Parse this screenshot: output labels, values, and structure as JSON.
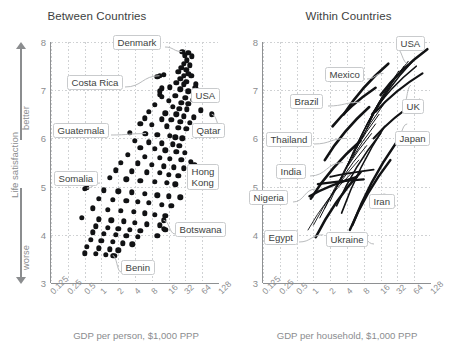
{
  "figure": {
    "ylabel": "Life satisfaction",
    "arrow_up": "better",
    "arrow_down": "worse",
    "yticks": [
      "8",
      "7",
      "6",
      "5",
      "4",
      "3"
    ],
    "xticks": [
      "0.125",
      "0.25",
      "0.5",
      "1",
      "2",
      "4",
      "8",
      "16",
      "32",
      "64",
      "128"
    ],
    "ylim": [
      3,
      8
    ],
    "xlim_log2": [
      -3,
      7
    ],
    "colors": {
      "dot": "#111214",
      "axis": "#8e9092",
      "grid": "#cfd1d3",
      "text": "#57585a",
      "tick_text": "#8b8d8f",
      "title": "#3d3f41"
    }
  },
  "panels": [
    {
      "title": "Between Countries",
      "xlabel": "GDP per person, $1,000 PPP"
    },
    {
      "title": "Within Countries",
      "xlabel": "GDP per household, $1,000 PPP"
    }
  ],
  "chart_data": [
    {
      "type": "scatter",
      "title": "Between Countries",
      "xlabel": "GDP per person, $1,000 PPP",
      "ylabel": "Life satisfaction",
      "xscale": "log2",
      "xlim": [
        0.125,
        128
      ],
      "ylim": [
        3,
        8
      ],
      "grid": true,
      "xticks": [
        0.125,
        0.25,
        0.5,
        1,
        2,
        4,
        8,
        16,
        32,
        64,
        128
      ],
      "yticks": [
        3,
        4,
        5,
        6,
        7,
        8
      ],
      "annotations": [
        "Denmark",
        "Costa Rica",
        "USA",
        "Guatemala",
        "Qatar",
        "Somalia",
        "Hong Kong",
        "Botswana",
        "Benin"
      ],
      "points": [
        [
          36,
          7.78
        ],
        [
          31,
          7.72
        ],
        [
          42,
          7.7
        ],
        [
          34,
          7.62
        ],
        [
          30,
          7.55
        ],
        [
          38,
          7.52
        ],
        [
          27,
          7.46
        ],
        [
          33,
          7.42
        ],
        [
          24,
          7.38
        ],
        [
          36,
          7.34
        ],
        [
          30,
          7.3
        ],
        [
          41,
          7.3
        ],
        [
          26,
          7.24
        ],
        [
          13,
          7.32
        ],
        [
          10,
          7.28
        ],
        [
          33,
          7.18
        ],
        [
          22,
          7.15
        ],
        [
          30,
          7.12
        ],
        [
          49,
          7.12
        ],
        [
          17,
          7.06
        ],
        [
          12,
          7.04
        ],
        [
          11,
          6.98
        ],
        [
          26,
          7.02
        ],
        [
          36,
          6.98
        ],
        [
          11,
          6.9
        ],
        [
          12,
          6.86
        ],
        [
          21,
          6.88
        ],
        [
          32,
          6.84
        ],
        [
          44,
          6.8
        ],
        [
          16,
          6.78
        ],
        [
          27,
          6.74
        ],
        [
          36,
          6.72
        ],
        [
          9,
          6.7
        ],
        [
          19,
          6.66
        ],
        [
          25,
          6.62
        ],
        [
          34,
          6.6
        ],
        [
          60,
          6.58
        ],
        [
          7,
          6.55
        ],
        [
          14,
          6.52
        ],
        [
          22,
          6.5
        ],
        [
          30,
          6.46
        ],
        [
          45,
          6.44
        ],
        [
          6,
          6.42
        ],
        [
          12,
          6.4
        ],
        [
          18,
          6.38
        ],
        [
          26,
          6.35
        ],
        [
          38,
          6.32
        ],
        [
          5,
          6.3
        ],
        [
          8,
          6.28
        ],
        [
          15,
          6.25
        ],
        [
          24,
          6.22
        ],
        [
          33,
          6.2
        ],
        [
          3.2,
          6.12
        ],
        [
          6,
          6.1
        ],
        [
          10,
          6.08
        ],
        [
          17,
          6.05
        ],
        [
          21,
          6.02
        ],
        [
          28,
          6.0
        ],
        [
          4,
          5.95
        ],
        [
          7,
          5.92
        ],
        [
          12,
          5.9
        ],
        [
          19,
          5.88
        ],
        [
          25,
          5.85
        ],
        [
          5,
          5.8
        ],
        [
          9,
          5.78
        ],
        [
          14,
          5.75
        ],
        [
          22,
          5.72
        ],
        [
          31,
          5.7
        ],
        [
          3,
          5.66
        ],
        [
          6,
          5.62
        ],
        [
          11,
          5.6
        ],
        [
          17,
          5.58
        ],
        [
          27,
          5.56
        ],
        [
          40,
          5.52
        ],
        [
          2.2,
          5.5
        ],
        [
          4.5,
          5.48
        ],
        [
          8,
          5.45
        ],
        [
          13,
          5.42
        ],
        [
          20,
          5.4
        ],
        [
          30,
          5.38
        ],
        [
          1.8,
          5.34
        ],
        [
          3.5,
          5.32
        ],
        [
          6.5,
          5.3
        ],
        [
          11,
          5.28
        ],
        [
          16,
          5.25
        ],
        [
          24,
          5.22
        ],
        [
          55,
          5.3
        ],
        [
          1.4,
          5.18
        ],
        [
          2.8,
          5.15
        ],
        [
          5,
          5.12
        ],
        [
          9,
          5.1
        ],
        [
          15,
          5.08
        ],
        [
          21,
          5.05
        ],
        [
          0.5,
          4.95
        ],
        [
          1.1,
          4.92
        ],
        [
          2,
          4.9
        ],
        [
          3.5,
          4.88
        ],
        [
          6,
          4.85
        ],
        [
          10,
          4.82
        ],
        [
          16,
          4.8
        ],
        [
          26,
          4.78
        ],
        [
          0.9,
          4.75
        ],
        [
          1.6,
          4.72
        ],
        [
          2.8,
          4.7
        ],
        [
          4.5,
          4.68
        ],
        [
          7,
          4.66
        ],
        [
          12,
          4.62
        ],
        [
          18,
          4.6
        ],
        [
          0.7,
          4.55
        ],
        [
          1.3,
          4.52
        ],
        [
          2.2,
          4.5
        ],
        [
          3.8,
          4.48
        ],
        [
          6,
          4.45
        ],
        [
          9,
          4.42
        ],
        [
          14,
          4.4
        ],
        [
          0.45,
          4.35
        ],
        [
          0.9,
          4.32
        ],
        [
          1.5,
          4.3
        ],
        [
          2.5,
          4.28
        ],
        [
          4,
          4.25
        ],
        [
          6.5,
          4.22
        ],
        [
          11,
          4.2
        ],
        [
          0.8,
          4.18
        ],
        [
          1.3,
          4.15
        ],
        [
          2,
          4.12
        ],
        [
          3.2,
          4.1
        ],
        [
          5,
          4.08
        ],
        [
          13,
          4.12
        ],
        [
          14,
          4.1
        ],
        [
          0.7,
          4.05
        ],
        [
          1.1,
          4.02
        ],
        [
          1.8,
          4.0
        ],
        [
          2.8,
          3.98
        ],
        [
          4.5,
          3.96
        ],
        [
          10,
          3.98
        ],
        [
          0.65,
          3.9
        ],
        [
          1,
          3.88
        ],
        [
          1.6,
          3.85
        ],
        [
          2.4,
          3.82
        ],
        [
          3.6,
          3.8
        ],
        [
          0.55,
          3.75
        ],
        [
          0.9,
          3.72
        ],
        [
          1.4,
          3.7
        ],
        [
          2,
          3.68
        ],
        [
          0.5,
          3.62
        ],
        [
          0.8,
          3.6
        ],
        [
          1.2,
          3.58
        ],
        [
          1.7,
          3.56
        ]
      ],
      "labeled_points": [
        {
          "name": "Denmark",
          "x": 28,
          "y": 7.8
        },
        {
          "name": "Costa Rica",
          "x": 11,
          "y": 7.3
        },
        {
          "name": "USA",
          "x": 48,
          "y": 7.05
        },
        {
          "name": "Guatemala",
          "x": 6.3,
          "y": 6.1
        },
        {
          "name": "Qatar",
          "x": 95,
          "y": 6.5
        },
        {
          "name": "Somalia",
          "x": 0.55,
          "y": 4.97
        },
        {
          "name": "Hong Kong",
          "x": 46,
          "y": 5.45
        },
        {
          "name": "Botswana",
          "x": 13,
          "y": 4.3
        },
        {
          "name": "Benin",
          "x": 1.6,
          "y": 3.57
        }
      ]
    },
    {
      "type": "line",
      "title": "Within Countries",
      "xlabel": "GDP per household, $1,000 PPP",
      "ylabel": "Life satisfaction",
      "xscale": "log2",
      "xlim": [
        0.125,
        128
      ],
      "ylim": [
        3,
        8
      ],
      "grid": true,
      "xticks": [
        0.125,
        0.25,
        0.5,
        1,
        2,
        4,
        8,
        16,
        32,
        64,
        128
      ],
      "yticks": [
        3,
        4,
        5,
        6,
        7,
        8
      ],
      "annotations": [
        "USA",
        "Mexico",
        "UK",
        "Brazil",
        "Japan",
        "Thailand",
        "India",
        "Nigeria",
        "Iran",
        "Egypt",
        "Ukraine"
      ],
      "series": [
        {
          "name": "USA",
          "x": [
            16,
            110
          ],
          "y": [
            6.9,
            7.85
          ],
          "weight": 2.6
        },
        {
          "name": "UK",
          "x": [
            13,
            90
          ],
          "y": [
            6.55,
            7.35
          ],
          "weight": 2.2
        },
        {
          "name": "Japan",
          "x": [
            12,
            80
          ],
          "y": [
            6.0,
            6.8
          ],
          "weight": 2.2
        },
        {
          "name": "Mexico",
          "x": [
            3.5,
            22
          ],
          "y": [
            6.5,
            7.55
          ],
          "weight": 2.6
        },
        {
          "name": "Brazil",
          "x": [
            2.2,
            13
          ],
          "y": [
            6.25,
            7.05
          ],
          "weight": 2.6
        },
        {
          "name": "Thailand",
          "x": [
            1.6,
            10
          ],
          "y": [
            5.55,
            6.65
          ],
          "weight": 2.6
        },
        {
          "name": "India",
          "x": [
            0.9,
            7
          ],
          "y": [
            4.75,
            5.95
          ],
          "weight": 2.6
        },
        {
          "name": "Nigeria",
          "x": [
            0.85,
            6
          ],
          "y": [
            4.8,
            5.2
          ],
          "weight": 2.4
        },
        {
          "name": "Iran",
          "x": [
            5,
            30
          ],
          "y": [
            4.2,
            5.9
          ],
          "weight": 2.4
        },
        {
          "name": "Egypt",
          "x": [
            1.1,
            7
          ],
          "y": [
            3.95,
            5.3
          ],
          "weight": 2.6
        },
        {
          "name": "Ukraine",
          "x": [
            4.5,
            24
          ],
          "y": [
            4.1,
            5.55
          ],
          "weight": 2.4
        },
        {
          "name": "other-1",
          "x": [
            1.3,
            9
          ],
          "y": [
            4.35,
            5.85
          ],
          "weight": 1.0
        },
        {
          "name": "other-2",
          "x": [
            1.6,
            11
          ],
          "y": [
            4.55,
            6.1
          ],
          "weight": 1.0
        },
        {
          "name": "other-3",
          "x": [
            2.0,
            13
          ],
          "y": [
            4.7,
            6.3
          ],
          "weight": 1.0
        },
        {
          "name": "other-4",
          "x": [
            2.4,
            15
          ],
          "y": [
            4.9,
            6.5
          ],
          "weight": 1.0
        },
        {
          "name": "other-5",
          "x": [
            3.0,
            18
          ],
          "y": [
            5.1,
            6.7
          ],
          "weight": 1.0
        },
        {
          "name": "other-6",
          "x": [
            3.6,
            20
          ],
          "y": [
            5.3,
            6.9
          ],
          "weight": 1.0
        },
        {
          "name": "other-7",
          "x": [
            4.2,
            24
          ],
          "y": [
            5.45,
            7.1
          ],
          "weight": 1.0
        },
        {
          "name": "other-8",
          "x": [
            5.0,
            28
          ],
          "y": [
            5.6,
            7.25
          ],
          "weight": 1.0
        },
        {
          "name": "other-9",
          "x": [
            6.0,
            34
          ],
          "y": [
            5.8,
            7.4
          ],
          "weight": 1.0
        },
        {
          "name": "other-10",
          "x": [
            7.5,
            42
          ],
          "y": [
            6.0,
            7.5
          ],
          "weight": 1.0
        },
        {
          "name": "other-11",
          "x": [
            9,
            50
          ],
          "y": [
            6.2,
            7.6
          ],
          "weight": 1.0
        },
        {
          "name": "other-12",
          "x": [
            0.8,
            5
          ],
          "y": [
            4.1,
            5.3
          ],
          "weight": 0.9
        },
        {
          "name": "other-13",
          "x": [
            1.0,
            6.5
          ],
          "y": [
            4.2,
            5.55
          ],
          "weight": 0.9
        },
        {
          "name": "other-14",
          "x": [
            2.6,
            16
          ],
          "y": [
            4.6,
            6.1
          ],
          "weight": 1.6
        },
        {
          "name": "other-15",
          "x": [
            3.2,
            19
          ],
          "y": [
            4.45,
            6.25
          ],
          "weight": 1.6
        },
        {
          "name": "other-16",
          "x": [
            10,
            60
          ],
          "y": [
            6.35,
            7.6
          ],
          "weight": 1.6
        },
        {
          "name": "other-17",
          "x": [
            11,
            70
          ],
          "y": [
            6.5,
            7.5
          ],
          "weight": 1.4
        },
        {
          "name": "other-18",
          "x": [
            1.2,
            8
          ],
          "y": [
            5.05,
            5.15
          ],
          "weight": 2.2
        },
        {
          "name": "other-19",
          "x": [
            2.0,
            12
          ],
          "y": [
            5.2,
            5.35
          ],
          "weight": 1.8
        }
      ],
      "labeled_segments": [
        {
          "name": "USA",
          "anchor_x": 50,
          "anchor_y": 7.55
        },
        {
          "name": "Mexico",
          "anchor_x": 18,
          "anchor_y": 7.35
        },
        {
          "name": "UK",
          "anchor_x": 56,
          "anchor_y": 7.1
        },
        {
          "name": "Brazil",
          "anchor_x": 7,
          "anchor_y": 6.75
        },
        {
          "name": "Japan",
          "anchor_x": 48,
          "anchor_y": 6.3
        },
        {
          "name": "Thailand",
          "anchor_x": 4,
          "anchor_y": 6.0
        },
        {
          "name": "India",
          "anchor_x": 3.4,
          "anchor_y": 5.5
        },
        {
          "name": "Nigeria",
          "anchor_x": 1.1,
          "anchor_y": 4.95
        },
        {
          "name": "Iran",
          "anchor_x": 18,
          "anchor_y": 4.85
        },
        {
          "name": "Egypt",
          "anchor_x": 1.5,
          "anchor_y": 4.0
        },
        {
          "name": "Ukraine",
          "anchor_x": 6.5,
          "anchor_y": 4.0
        }
      ]
    }
  ]
}
